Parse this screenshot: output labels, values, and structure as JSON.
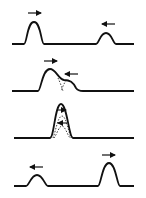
{
  "figure": {
    "description": "Four-stage diagram of two pulses on a string approaching, overlapping, superposing and passing through each other",
    "stroke_color": "#111111",
    "background_color": "#ffffff",
    "panels": [
      {
        "label": "stage-1-approach",
        "pulse_left": "large",
        "pulse_right": "small",
        "left_arrow": "right",
        "right_arrow": "left"
      },
      {
        "label": "stage-2-overlap",
        "pulse_left": "large",
        "pulse_right": "small",
        "left_arrow": "right",
        "right_arrow": "left",
        "dashed_components": true
      },
      {
        "label": "stage-3-superposition",
        "combined": "single tall pulse",
        "arrows": [
          "right",
          "left"
        ],
        "dashed_components": true
      },
      {
        "label": "stage-4-separated",
        "pulse_left": "small",
        "pulse_right": "large",
        "left_arrow": "left",
        "right_arrow": "right"
      }
    ]
  }
}
